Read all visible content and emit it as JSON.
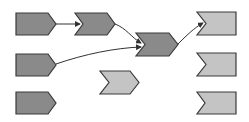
{
  "diagram": {
    "colors": {
      "dark_fill": "#8a8a8a",
      "light_fill": "#c4c4c4",
      "stroke": "#3a3a3a",
      "connector": "#333333",
      "background": "#ffffff"
    },
    "nodes": [
      {
        "id": "pentagon-1",
        "shape": "pentagon",
        "fill": "dark",
        "x": 16,
        "y": 13,
        "w": 40,
        "h": 22
      },
      {
        "id": "pentagon-2",
        "shape": "pentagon",
        "fill": "dark",
        "x": 16,
        "y": 54,
        "w": 40,
        "h": 22
      },
      {
        "id": "pentagon-3",
        "shape": "pentagon",
        "fill": "dark",
        "x": 16,
        "y": 92,
        "w": 40,
        "h": 22
      },
      {
        "id": "chevron-1",
        "shape": "chevron",
        "fill": "dark",
        "x": 75,
        "y": 13,
        "w": 40,
        "h": 22
      },
      {
        "id": "chevron-2",
        "shape": "chevron",
        "fill": "dark",
        "x": 136,
        "y": 33,
        "w": 42,
        "h": 23
      },
      {
        "id": "chevron-3",
        "shape": "chevron",
        "fill": "light",
        "x": 100,
        "y": 71,
        "w": 39,
        "h": 23
      },
      {
        "id": "notched-1",
        "shape": "notched",
        "fill": "light",
        "x": 197,
        "y": 12,
        "w": 39,
        "h": 23
      },
      {
        "id": "notched-2",
        "shape": "notched",
        "fill": "light",
        "x": 197,
        "y": 53,
        "w": 39,
        "h": 23
      },
      {
        "id": "notched-3",
        "shape": "notched",
        "fill": "light",
        "x": 197,
        "y": 92,
        "w": 39,
        "h": 22
      }
    ],
    "edges": [
      {
        "from": "pentagon-1",
        "to": "chevron-1",
        "path": "M56,24 L80,24"
      },
      {
        "from": "chevron-1",
        "to": "chevron-2",
        "path": "M115,24 C126,28 132,38 141,43"
      },
      {
        "from": "pentagon-2",
        "to": "chevron-2",
        "path": "M56,64 C85,54 115,48 141,47"
      },
      {
        "from": "chevron-2",
        "to": "notched-1",
        "path": "M178,44 C186,36 194,28 203,23"
      }
    ]
  }
}
